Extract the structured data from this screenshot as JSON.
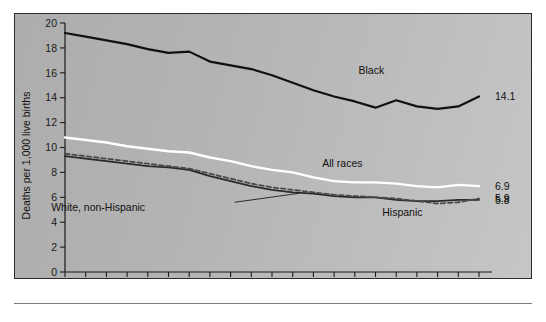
{
  "figure": {
    "background_color": "#b5b5b5",
    "border_color": "#2b2b2b"
  },
  "chart_data": {
    "type": "line",
    "title": "",
    "subtitle": "",
    "xlabel": "",
    "ylabel": "Deaths per 1,000 live births",
    "xlim": [
      1983,
      2003
    ],
    "ylim": [
      0,
      20
    ],
    "ytick_step": 2,
    "yticks": [
      0,
      2,
      4,
      6,
      8,
      10,
      12,
      14,
      16,
      18,
      20
    ],
    "ytick_labels": [
      "0",
      "2",
      "4",
      "6",
      "8",
      "10",
      "12",
      "14",
      "16",
      "18",
      "20"
    ],
    "xticks": [
      1983,
      1984,
      1985,
      1986,
      1987,
      1988,
      1989,
      1990,
      1991,
      1992,
      1993,
      1994,
      1995,
      1996,
      1997,
      1998,
      1999,
      2000,
      2001,
      2002,
      2003
    ],
    "xtick_labels_shown": [
      "1983",
      "1985",
      "1990",
      "1995",
      "2000",
      "2003"
    ],
    "xtick_labels_shown_values": [
      1983,
      1985,
      1990,
      1995,
      2000,
      2003
    ],
    "grid": false,
    "legend": "inline-annotations",
    "x": [
      1983,
      1984,
      1985,
      1986,
      1987,
      1988,
      1989,
      1990,
      1991,
      1992,
      1993,
      1994,
      1995,
      1996,
      1997,
      1998,
      1999,
      2000,
      2001,
      2002,
      2003
    ],
    "series": [
      {
        "name": "Black",
        "label": "Black",
        "color": "#111111",
        "style": "solid",
        "width": 2.2,
        "end_value_label": "14.1",
        "values": [
          19.2,
          18.9,
          18.6,
          18.3,
          17.9,
          17.6,
          17.7,
          16.9,
          16.6,
          16.3,
          15.8,
          15.2,
          14.6,
          14.1,
          13.7,
          13.2,
          13.8,
          13.3,
          13.1,
          13.3,
          14.1
        ]
      },
      {
        "name": "All races",
        "label": "All races",
        "color": "#ffffff",
        "style": "solid",
        "width": 2.4,
        "end_value_label": "6.9",
        "values": [
          10.8,
          10.6,
          10.4,
          10.1,
          9.9,
          9.7,
          9.6,
          9.2,
          8.9,
          8.5,
          8.2,
          8.0,
          7.6,
          7.3,
          7.2,
          7.2,
          7.1,
          6.9,
          6.8,
          7.0,
          6.9
        ]
      },
      {
        "name": "White, non-Hispanic",
        "label": "White, non-Hispanic",
        "color": "#2a2a2a",
        "style": "solid",
        "width": 1.8,
        "end_value_label": "5.8",
        "values": [
          9.3,
          9.1,
          8.9,
          8.7,
          8.5,
          8.4,
          8.2,
          7.7,
          7.3,
          6.9,
          6.6,
          6.4,
          6.3,
          6.1,
          6.0,
          6.0,
          5.8,
          5.7,
          5.7,
          5.8,
          5.8
        ]
      },
      {
        "name": "Hispanic",
        "label": "Hispanic",
        "color": "#4a4a4a",
        "style": "dashed",
        "width": 1.8,
        "end_value_label": "5.9",
        "values": [
          9.5,
          9.3,
          9.1,
          8.9,
          8.7,
          8.5,
          8.3,
          7.9,
          7.5,
          7.1,
          6.8,
          6.6,
          6.4,
          6.2,
          6.1,
          6.0,
          5.9,
          5.7,
          5.5,
          5.6,
          5.9
        ]
      }
    ],
    "annotations": [
      {
        "name": "black-label",
        "text": "Black",
        "x": 1997.8,
        "y": 15.9
      },
      {
        "name": "all-races-label",
        "text": "All races",
        "x": 1996.4,
        "y": 8.4
      },
      {
        "name": "white-non-hispanic-label",
        "text": "White, non-Hispanic",
        "x": 1984.6,
        "y": 4.9
      },
      {
        "name": "hispanic-label",
        "text": "Hispanic",
        "x": 1999.3,
        "y": 4.5
      }
    ],
    "end_labels": [
      {
        "name": "end-label-black",
        "text": "14.1",
        "y": 14.1
      },
      {
        "name": "end-label-all-races",
        "text": "6.9",
        "y": 6.9
      },
      {
        "name": "end-label-hispanic",
        "text": "5.9",
        "y": 5.9
      },
      {
        "name": "end-label-white",
        "text": "5.8",
        "y": 5.8
      }
    ]
  }
}
